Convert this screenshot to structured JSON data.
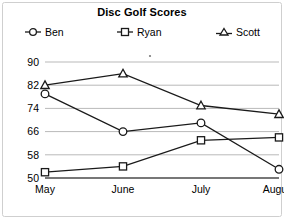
{
  "chart_data": {
    "type": "line",
    "title": "Disc Golf Scores",
    "xlabel": "",
    "ylabel": "",
    "categories": [
      "May",
      "June",
      "July",
      "August"
    ],
    "series": [
      {
        "name": "Ben",
        "marker": "circle",
        "values": [
          79,
          66,
          69,
          53
        ]
      },
      {
        "name": "Ryan",
        "marker": "square",
        "values": [
          52,
          54,
          63,
          64
        ]
      },
      {
        "name": "Scott",
        "marker": "triangle",
        "values": [
          82,
          86,
          75,
          72
        ]
      }
    ],
    "ylim": [
      50,
      90
    ],
    "yticks": [
      50,
      58,
      66,
      74,
      82,
      90
    ],
    "ytick_labels": [
      "50",
      "58",
      "66",
      "74",
      "82",
      "90"
    ],
    "grid": true,
    "legend_position": "top",
    "colors": {
      "line": "#1a1a1a",
      "grid": "#b9b9b9",
      "axis": "#4a4a4a",
      "background": "#ffffff",
      "text": "#000000"
    }
  },
  "legend": {
    "items": [
      {
        "label": "Ben",
        "icon": "circle-marker-icon"
      },
      {
        "label": "Ryan",
        "icon": "square-marker-icon"
      },
      {
        "label": "Scott",
        "icon": "triangle-marker-icon"
      }
    ]
  }
}
